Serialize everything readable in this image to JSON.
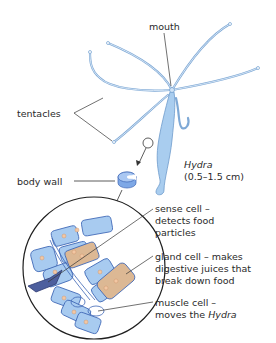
{
  "labels": {
    "mouth": "mouth",
    "tentacles": "tentacles",
    "body_wall": "body wall",
    "organism_name": "Hydra",
    "organism_size": "(0.5–1.5 cm)",
    "sense_cell_line1": "sense cell –",
    "sense_cell_line2": "detects food",
    "sense_cell_line3": "particles",
    "gland_cell_line1": "gland cell – makes",
    "gland_cell_line2": "digestive juices that",
    "gland_cell_line3": "break down food",
    "muscle_cell_line1": "muscle cell –",
    "muscle_cell_line2_prefix": "moves the ",
    "muscle_cell_line2_italic": "Hydra"
  },
  "colors": {
    "hydra_body": "#a9cdef",
    "hydra_outline": "#5d8fc4",
    "cell_blue": "#a8cbf0",
    "cell_outline": "#3d66b5",
    "gland_cell": "#dcb894",
    "sense_cell": "#4d5f9e",
    "nucleus": "#f2c7a3",
    "leader_line": "#333333"
  }
}
